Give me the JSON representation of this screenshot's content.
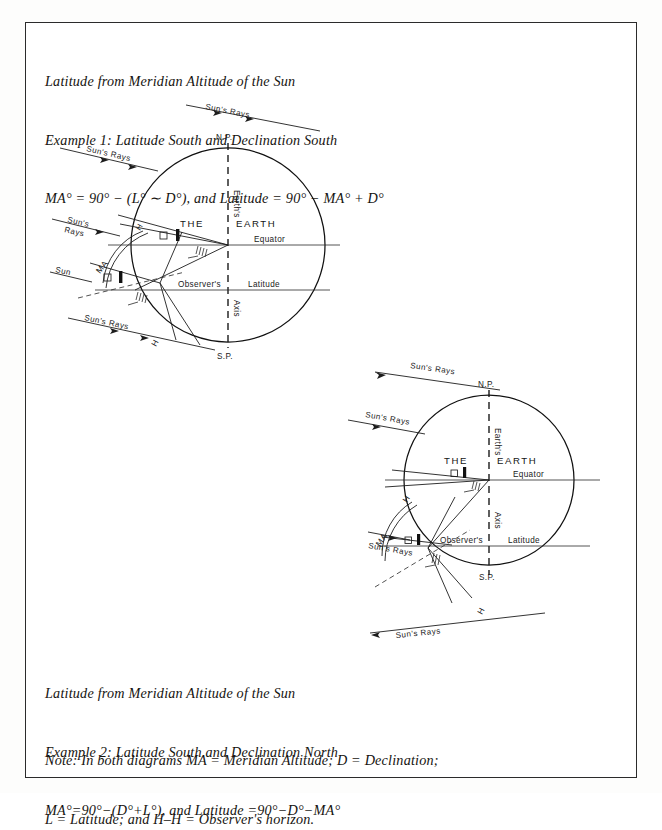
{
  "document": {
    "border_color": "#2b2b2b",
    "background": "#ffffff"
  },
  "header": {
    "line1": "Latitude from Meridian Altitude of the Sun",
    "line2": "Example 1: Latitude South and Declination South",
    "line3": "MA° = 90° − (L° ∼ D°), and Latitude = 90° − MA° + D°"
  },
  "example2": {
    "line1": "Latitude from Meridian Altitude of the Sun",
    "line2": "Example 2: Latitude South and Declination North",
    "line3": "MA°=90°−(D°+L°), and Latitude =90°−D°−MA°"
  },
  "note": {
    "line1": "Note: In both diagrams MA = Meridian Altitude; D = Declination;",
    "line2": "L = Latitude; and H–H = Observer's horizon."
  },
  "diagram1": {
    "caption_ref": "Example 1",
    "earth_label_the": "THE",
    "earth_label_earth": "EARTH",
    "north_pole": "N.P.",
    "south_pole": "S.P.",
    "axis_line1": "Earth's",
    "axis_line2": "Axis",
    "equator": "Equator",
    "observers": "Observer's",
    "latitude": "Latitude",
    "sun": "Sun",
    "ma_arc_label": "MA",
    "horizon_label_top": "H",
    "horizon_label_bottom": "H",
    "sun_rays_1": "Sun's Rays",
    "sun_rays_2": "Sun's Rays",
    "sun_rays_3_line1": "Sun's",
    "sun_rays_3_line2": "Rays",
    "sun_rays_4": "Sun's Rays"
  },
  "diagram2": {
    "caption_ref": "Example 2",
    "earth_label_the": "THE",
    "earth_label_earth": "EARTH",
    "north_pole": "N.P.",
    "south_pole": "S.P.",
    "axis_line1": "Earth's",
    "axis_line2": "Axis",
    "equator": "Equator",
    "observers": "Observer's",
    "latitude": "Latitude",
    "ma_arc_label": "MA",
    "horizon_label_top": "H",
    "horizon_label_bottom": "H",
    "sun_rays_1": "Sun's Rays",
    "sun_rays_2": "Sun's Rays",
    "sun_rays_3": "Sun's Rays",
    "sun_rays_4": "Sun's Rays"
  }
}
